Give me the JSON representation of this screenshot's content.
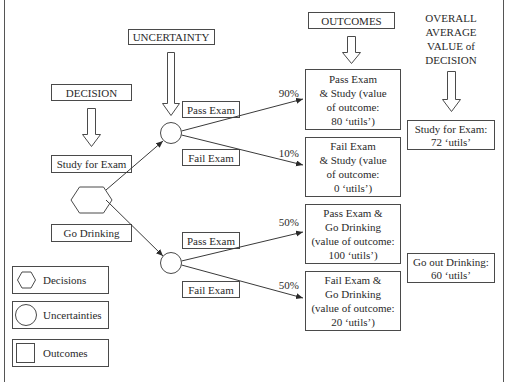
{
  "headers": {
    "uncertainty": "UNCERTAINTY",
    "decision": "DECISION",
    "outcomes": "OUTCOMES",
    "overall": [
      "OVERALL",
      "AVERAGE",
      "VALUE of",
      "DECISION"
    ]
  },
  "decisions": {
    "study": "Study for Exam",
    "drinking": "Go Drinking"
  },
  "branches": {
    "upper_pass": "Pass Exam",
    "upper_fail": "Fail Exam",
    "lower_pass": "Pass Exam",
    "lower_fail": "Fail Exam"
  },
  "probabilities": {
    "upper_pass": "90%",
    "upper_fail": "10%",
    "lower_pass": "50%",
    "lower_fail": "50%"
  },
  "outcomes": [
    {
      "lines": [
        "Pass Exam",
        "& Study (value",
        "of outcome:",
        "80 ‘utils’)"
      ]
    },
    {
      "lines": [
        "Fail Exam",
        "& Study (value",
        "of outcome:",
        "0 ‘utils’)"
      ]
    },
    {
      "lines": [
        "Pass Exam &",
        "Go Drinking",
        "(value of outcome:",
        "100 ‘utils’)"
      ]
    },
    {
      "lines": [
        "Fail Exam &",
        "Go Drinking",
        "(value of outcome:",
        "20 ‘utils’)"
      ]
    }
  ],
  "overall_values": [
    {
      "lines": [
        "Study for Exam:",
        "72 ‘utils’"
      ]
    },
    {
      "lines": [
        "Go out Drinking:",
        "60 ‘utils’"
      ]
    }
  ],
  "legend": {
    "decisions": "Decisions",
    "uncertainties": "Uncertainties",
    "outcomes": "Outcomes"
  },
  "colors": {
    "stroke": "#4a4a4a",
    "text": "#2a2a2a",
    "background": "#ffffff"
  }
}
